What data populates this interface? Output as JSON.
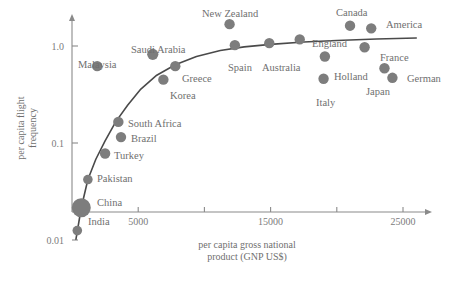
{
  "chart_data": {
    "type": "scatter",
    "title": "",
    "xlabel": "per capita gross national product (GNP US$)",
    "ylabel": "per capita flight frequency",
    "xlabel_line1": "per capita gross national",
    "xlabel_line2": "product (GNP US$)",
    "ylabel_line1": "per capita flight",
    "ylabel_line2": "frequency",
    "xlim": [
      0,
      27000
    ],
    "ylim": [
      0.01,
      2.0
    ],
    "yscale": "log",
    "xscale": "linear",
    "grid": false,
    "legend": "none",
    "xticks": [
      5000,
      10000,
      15000,
      20000,
      25000
    ],
    "xticklabels": [
      "5000",
      "",
      "15000",
      "",
      "25000"
    ],
    "yticks": [
      0.01,
      0.1,
      1.0
    ],
    "yticklabels": [
      "0.01",
      "0.1",
      "1.0"
    ],
    "marker_color": "#7d7d7d",
    "line_color": "#4a4a4a",
    "axis_color": "#8a8a8a",
    "label_color": "#6f6f6f",
    "points": [
      {
        "name": "India",
        "x": 400,
        "y": 0.0125,
        "size": 4.8,
        "lx": 88,
        "ly": 225,
        "anchor": "start"
      },
      {
        "name": "China",
        "x": 700,
        "y": 0.0215,
        "size": 9.5,
        "lx": 97,
        "ly": 206,
        "anchor": "start"
      },
      {
        "name": "Pakistan",
        "x": 1200,
        "y": 0.042,
        "size": 4.8,
        "lx": 97,
        "ly": 182,
        "anchor": "start"
      },
      {
        "name": "Turkey",
        "x": 2500,
        "y": 0.078,
        "size": 5.2,
        "lx": 114,
        "ly": 159,
        "anchor": "start"
      },
      {
        "name": "Brazil",
        "x": 3700,
        "y": 0.115,
        "size": 5.2,
        "lx": 131,
        "ly": 142,
        "anchor": "start"
      },
      {
        "name": "South Africa",
        "x": 3500,
        "y": 0.165,
        "size": 5.2,
        "lx": 128,
        "ly": 127,
        "anchor": "start"
      },
      {
        "name": "Malaysia",
        "x": 1900,
        "y": 0.62,
        "size": 5.2,
        "lx": 78,
        "ly": 68,
        "anchor": "start"
      },
      {
        "name": "Korea",
        "x": 6900,
        "y": 0.45,
        "size": 5.2,
        "lx": 170,
        "ly": 99,
        "anchor": "start"
      },
      {
        "name": "Greece",
        "x": 7800,
        "y": 0.62,
        "size": 5.2,
        "lx": 182,
        "ly": 82,
        "anchor": "start"
      },
      {
        "name": "Saudi Arabia",
        "x": 6100,
        "y": 0.82,
        "size": 5.6,
        "lx": 131,
        "ly": 53,
        "anchor": "start"
      },
      {
        "name": "Spain",
        "x": 12300,
        "y": 1.02,
        "size": 5.2,
        "lx": 228,
        "ly": 71,
        "anchor": "start"
      },
      {
        "name": "New Zealand",
        "x": 11900,
        "y": 1.68,
        "size": 5.2,
        "lx": 202,
        "ly": 17,
        "anchor": "start"
      },
      {
        "name": "Australia",
        "x": 14900,
        "y": 1.07,
        "size": 5.2,
        "lx": 262,
        "ly": 71,
        "anchor": "start"
      },
      {
        "name": "England",
        "x": 17200,
        "y": 1.17,
        "size": 5.2,
        "lx": 312,
        "ly": 47,
        "anchor": "start"
      },
      {
        "name": "Canada",
        "x": 21000,
        "y": 1.62,
        "size": 5.2,
        "lx": 336,
        "ly": 16,
        "anchor": "start"
      },
      {
        "name": "America",
        "x": 22600,
        "y": 1.52,
        "size": 5.2,
        "lx": 386,
        "ly": 28,
        "anchor": "start"
      },
      {
        "name": "France",
        "x": 22100,
        "y": 0.97,
        "size": 5.2,
        "lx": 380,
        "ly": 61,
        "anchor": "start"
      },
      {
        "name": "Holland",
        "x": 19100,
        "y": 0.78,
        "size": 5.2,
        "lx": 334,
        "ly": 80,
        "anchor": "start"
      },
      {
        "name": "Italy",
        "x": 19000,
        "y": 0.46,
        "size": 5.2,
        "lx": 316,
        "ly": 106,
        "anchor": "start"
      },
      {
        "name": "Japan",
        "x": 24200,
        "y": 0.47,
        "size": 5.2,
        "lx": 366,
        "ly": 95,
        "anchor": "start"
      },
      {
        "name": "German",
        "x": 23600,
        "y": 0.59,
        "size": 5.2,
        "lx": 407,
        "ly": 82,
        "anchor": "start"
      }
    ],
    "trend_curve": [
      {
        "x": 300,
        "y": 0.0102
      },
      {
        "x": 700,
        "y": 0.0215
      },
      {
        "x": 1200,
        "y": 0.042
      },
      {
        "x": 1800,
        "y": 0.068
      },
      {
        "x": 2500,
        "y": 0.105
      },
      {
        "x": 3300,
        "y": 0.165
      },
      {
        "x": 4200,
        "y": 0.245
      },
      {
        "x": 5200,
        "y": 0.36
      },
      {
        "x": 6400,
        "y": 0.5
      },
      {
        "x": 7800,
        "y": 0.64
      },
      {
        "x": 9400,
        "y": 0.78
      },
      {
        "x": 11200,
        "y": 0.9
      },
      {
        "x": 13000,
        "y": 0.98
      },
      {
        "x": 15000,
        "y": 1.04
      },
      {
        "x": 17500,
        "y": 1.1
      },
      {
        "x": 20000,
        "y": 1.14
      },
      {
        "x": 23000,
        "y": 1.18
      },
      {
        "x": 26000,
        "y": 1.21
      }
    ]
  }
}
